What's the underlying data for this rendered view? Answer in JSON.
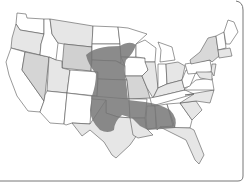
{
  "map": {
    "subject": "United States",
    "highlight_region": "central-plains-and-south band",
    "colors": {
      "background": "#ffffff",
      "state_white": "#ffffff",
      "state_light": "#e6e6e6",
      "state_medium": "#d0d0d0",
      "highlight": "#7a7a7a",
      "border": "#555555",
      "frame": "#777777"
    }
  }
}
